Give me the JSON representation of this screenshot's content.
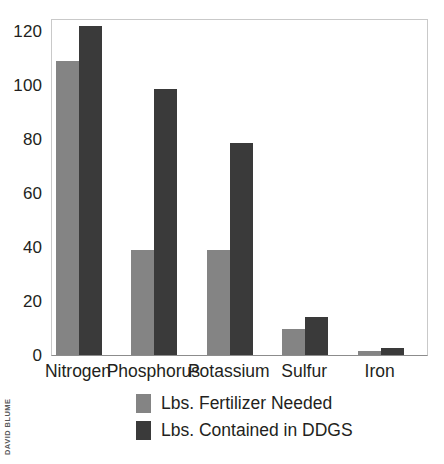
{
  "chart_data": {
    "type": "bar",
    "title": "",
    "subtitle": "",
    "xlabel": "",
    "ylabel": "",
    "categories": [
      "Nitrogen",
      "Phosphorus",
      "Potassium",
      "Sulfur",
      "Iron"
    ],
    "series": [
      {
        "name": "Lbs. Fertilizer Needed",
        "color": "#848484",
        "values": [
          109,
          39,
          39,
          9.5,
          1.5
        ]
      },
      {
        "name": "Lbs. Contained in DDGS",
        "color": "#3a3a3a",
        "values": [
          122,
          98.5,
          78.5,
          14,
          2.5
        ]
      }
    ],
    "ylim": [
      0,
      125
    ],
    "yticks": [
      0,
      20,
      40,
      60,
      80,
      100,
      120
    ],
    "ytick_labels": [
      "0",
      "20",
      "40",
      "60",
      "80",
      "100",
      "120"
    ],
    "grid": false,
    "legend_position": "bottom",
    "annotations": [
      "DAVID BLUME"
    ]
  },
  "legend": {
    "entries": [
      {
        "label": "Lbs. Fertilizer Needed",
        "color": "#848484"
      },
      {
        "label": "Lbs. Contained in DDGS",
        "color": "#3a3a3a"
      }
    ]
  },
  "credit": {
    "text": "DAVID BLUME"
  },
  "colors": {
    "series_0": "#848484",
    "series_1": "#3a3a3a",
    "frame": "#c9c9c9",
    "axis": "#8c8c8c",
    "text": "#231f20",
    "credit_text": "#58595b",
    "background": "#ffffff"
  }
}
